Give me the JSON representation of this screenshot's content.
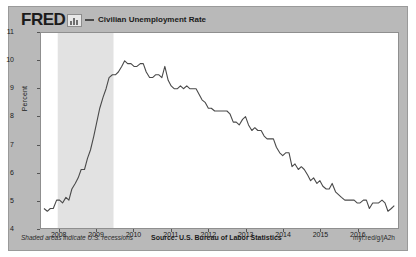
{
  "header": {
    "brand": "FRED",
    "logo_icon": "fred-logo-mark",
    "legend_label": "Civilian Unemployment Rate",
    "legend_color": "#4a4a4a"
  },
  "footer": {
    "note": "Shaded areas indicate U.S. recessions",
    "source": "Source: U.S. Bureau of Labor Statistics",
    "shortlink": "myf.red/g/jA2h"
  },
  "colors": {
    "background": "#b9b9b9",
    "plot_background": "#ffffff",
    "line": "#4a4a4a",
    "recession_shade": "#e2e2e2",
    "border": "#8f8f8f"
  },
  "chart_data": {
    "type": "line",
    "title": "Civilian Unemployment Rate",
    "xlabel": "",
    "ylabel": "Percent",
    "ylim": [
      4,
      11
    ],
    "yticks": [
      4,
      5,
      6,
      7,
      8,
      9,
      10,
      11
    ],
    "xlim": [
      2007.5,
      2017.1
    ],
    "xticks": [
      2008,
      2009,
      2010,
      2011,
      2012,
      2013,
      2014,
      2015,
      2016
    ],
    "xtick_labels": [
      "2008",
      "2009",
      "2010",
      "2011",
      "2012",
      "2013",
      "2014",
      "2015",
      "2016"
    ],
    "grid": false,
    "legend_position": "top",
    "shaded_regions": [
      {
        "label": "U.S. recession",
        "start": 2007.95,
        "end": 2009.45
      }
    ],
    "series": [
      {
        "name": "Civilian Unemployment Rate",
        "color": "#4a4a4a",
        "x": [
          2007.58,
          2007.67,
          2007.75,
          2007.83,
          2007.92,
          2008.0,
          2008.08,
          2008.17,
          2008.25,
          2008.33,
          2008.42,
          2008.5,
          2008.58,
          2008.67,
          2008.75,
          2008.83,
          2008.92,
          2009.0,
          2009.08,
          2009.17,
          2009.25,
          2009.33,
          2009.42,
          2009.5,
          2009.58,
          2009.67,
          2009.75,
          2009.83,
          2009.92,
          2010.0,
          2010.08,
          2010.17,
          2010.25,
          2010.33,
          2010.42,
          2010.5,
          2010.58,
          2010.67,
          2010.75,
          2010.83,
          2010.92,
          2011.0,
          2011.08,
          2011.17,
          2011.25,
          2011.33,
          2011.42,
          2011.5,
          2011.58,
          2011.67,
          2011.75,
          2011.83,
          2011.92,
          2012.0,
          2012.08,
          2012.17,
          2012.25,
          2012.33,
          2012.42,
          2012.5,
          2012.58,
          2012.67,
          2012.75,
          2012.83,
          2012.92,
          2013.0,
          2013.08,
          2013.17,
          2013.25,
          2013.33,
          2013.42,
          2013.5,
          2013.58,
          2013.67,
          2013.75,
          2013.83,
          2013.92,
          2014.0,
          2014.08,
          2014.17,
          2014.25,
          2014.33,
          2014.42,
          2014.5,
          2014.58,
          2014.67,
          2014.75,
          2014.83,
          2014.92,
          2015.0,
          2015.08,
          2015.17,
          2015.25,
          2015.33,
          2015.42,
          2015.5,
          2015.58,
          2015.67,
          2015.75,
          2015.83,
          2015.92,
          2016.0,
          2016.08,
          2016.17,
          2016.25,
          2016.33,
          2016.42,
          2016.5,
          2016.58,
          2016.67,
          2016.75,
          2016.83,
          2016.92,
          2017.0
        ],
        "values": [
          4.7,
          4.6,
          4.7,
          4.7,
          5.0,
          5.0,
          4.9,
          5.1,
          5.0,
          5.4,
          5.6,
          5.8,
          6.1,
          6.1,
          6.5,
          6.8,
          7.3,
          7.8,
          8.3,
          8.7,
          9.0,
          9.4,
          9.5,
          9.5,
          9.6,
          9.8,
          10.0,
          9.9,
          9.9,
          9.8,
          9.8,
          9.9,
          9.9,
          9.6,
          9.4,
          9.4,
          9.5,
          9.5,
          9.4,
          9.8,
          9.3,
          9.1,
          9.0,
          9.0,
          9.1,
          9.0,
          9.1,
          9.0,
          9.0,
          9.0,
          8.8,
          8.6,
          8.5,
          8.3,
          8.3,
          8.2,
          8.2,
          8.2,
          8.2,
          8.2,
          8.1,
          7.8,
          7.8,
          7.7,
          7.9,
          8.0,
          7.7,
          7.5,
          7.6,
          7.5,
          7.5,
          7.3,
          7.2,
          7.2,
          7.2,
          6.9,
          6.7,
          6.6,
          6.7,
          6.7,
          6.2,
          6.3,
          6.1,
          6.2,
          6.1,
          5.9,
          5.7,
          5.8,
          5.6,
          5.7,
          5.5,
          5.4,
          5.4,
          5.6,
          5.3,
          5.2,
          5.1,
          5.0,
          5.0,
          5.0,
          5.0,
          4.9,
          4.9,
          5.0,
          5.0,
          4.7,
          4.9,
          4.9,
          4.9,
          5.0,
          4.9,
          4.6,
          4.7,
          4.8
        ]
      }
    ]
  }
}
